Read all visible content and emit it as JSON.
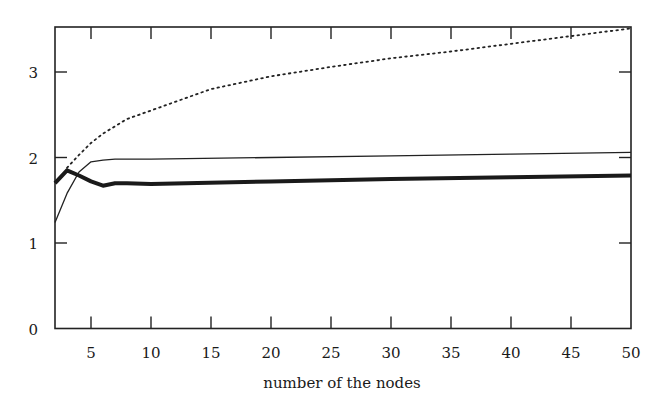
{
  "chart_data": {
    "type": "line",
    "title": "",
    "xlabel": "number of the nodes",
    "ylabel": "",
    "xlim": [
      2,
      50
    ],
    "ylim": [
      0,
      3.54
    ],
    "grid": false,
    "legend": null,
    "x_ticks": [
      5,
      10,
      15,
      20,
      25,
      30,
      35,
      40,
      45,
      50
    ],
    "x_tick_labels": [
      "5",
      "10",
      "15",
      "20",
      "25",
      "30",
      "35",
      "40",
      "45",
      "50"
    ],
    "y_ticks": [
      0,
      1,
      2,
      3
    ],
    "y_tick_labels": [
      "0",
      "1",
      "2",
      "3"
    ],
    "series": [
      {
        "name": "dotted curve",
        "style": "dotted",
        "x": [
          3,
          4,
          5,
          6,
          8,
          10,
          12,
          15,
          20,
          25,
          30,
          35,
          40,
          45,
          50
        ],
        "values": [
          1.88,
          2.03,
          2.17,
          2.28,
          2.45,
          2.55,
          2.65,
          2.8,
          2.95,
          3.06,
          3.16,
          3.24,
          3.33,
          3.42,
          3.51
        ]
      },
      {
        "name": "thin solid curve",
        "style": "solid-thin",
        "x": [
          2,
          3,
          4,
          5,
          6,
          7,
          10,
          20,
          30,
          40,
          50
        ],
        "values": [
          1.24,
          1.58,
          1.83,
          1.95,
          1.97,
          1.98,
          1.98,
          2.0,
          2.02,
          2.04,
          2.06
        ]
      },
      {
        "name": "thick solid curve",
        "style": "solid-thick",
        "x": [
          2,
          3,
          4,
          5,
          6,
          7,
          8,
          10,
          20,
          30,
          40,
          50
        ],
        "values": [
          1.7,
          1.85,
          1.79,
          1.72,
          1.67,
          1.7,
          1.7,
          1.69,
          1.72,
          1.75,
          1.77,
          1.79
        ]
      }
    ]
  }
}
